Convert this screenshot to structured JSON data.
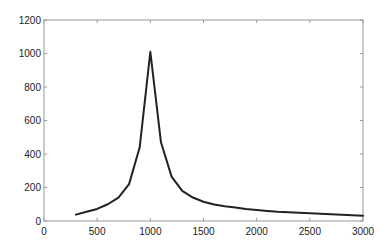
{
  "chart_data": {
    "type": "line",
    "title": "",
    "xlabel": "",
    "ylabel": "",
    "xlim": [
      0,
      3000
    ],
    "ylim": [
      0,
      1200
    ],
    "grid": false,
    "legend": null,
    "xticks": [
      0,
      500,
      1000,
      1500,
      2000,
      2500,
      3000
    ],
    "yticks": [
      0,
      200,
      400,
      600,
      800,
      1000,
      1200
    ],
    "xtick_labels": [
      "0",
      "500",
      "1000",
      "1500",
      "2000",
      "2500",
      "3000"
    ],
    "ytick_labels": [
      "0",
      "200",
      "400",
      "600",
      "800",
      "1000",
      "1200"
    ],
    "series": [
      {
        "name": "series-1",
        "color": "#222222",
        "x": [
          300,
          400,
          500,
          600,
          700,
          800,
          900,
          1000,
          1100,
          1200,
          1300,
          1400,
          1500,
          1600,
          1700,
          1800,
          1900,
          2000,
          2100,
          2200,
          2300,
          2400,
          2500,
          2600,
          2700,
          2800,
          2900,
          3000
        ],
        "y": [
          38,
          55,
          72,
          100,
          140,
          220,
          440,
          1010,
          470,
          265,
          180,
          140,
          115,
          98,
          88,
          80,
          72,
          66,
          60,
          55,
          52,
          49,
          46,
          43,
          40,
          37,
          34,
          32
        ]
      }
    ]
  }
}
